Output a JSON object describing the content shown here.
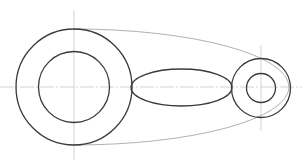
{
  "drawing": {
    "width": 304,
    "height": 167,
    "background": "#ffffff",
    "colors": {
      "shape_stroke": "#3a3a3a",
      "outline_stroke": "#a8a8a8",
      "centerline_stroke": "#c8c8c8"
    },
    "centerlines": {
      "horizontal": {
        "x1": 0,
        "y1": 87,
        "x2": 302,
        "y2": 87
      },
      "big_vertical": {
        "x1": 74,
        "y1": 10,
        "x2": 74,
        "y2": 160
      },
      "small_vertical": {
        "x1": 261,
        "y1": 45,
        "x2": 261,
        "y2": 131
      }
    },
    "big_ring": {
      "cx": 74,
      "cy": 87,
      "outer_r": 58,
      "inner_r": 35.5
    },
    "link_ellipse": {
      "cx": 181.5,
      "cy": 87.5,
      "rx": 50.5,
      "ry": 18.5
    },
    "small_ring": {
      "cx": 261,
      "cy": 88,
      "outer_r": 29.5,
      "inner_r": 14.5
    },
    "envelope_outline": {
      "start": [
        74,
        29
      ],
      "end": [
        74,
        145
      ],
      "rx": 215,
      "ry": 58,
      "path": "M 74 29 A 215 58 0 0 1 74 145"
    }
  }
}
